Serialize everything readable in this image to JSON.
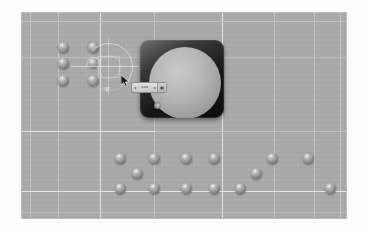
{
  "app": {
    "name": "3d-viewport-render",
    "view_label": "",
    "background_color": "#a9a9a9",
    "border_color": "#bdbdbd"
  },
  "viewport": {
    "name": "perspective-viewport",
    "width": 324,
    "height": 205,
    "origin_x": 22,
    "origin_y": 13,
    "grid": {
      "color": "#c2c2c2",
      "highlight_color": "#e6e6e6",
      "vertical_lines": [
        {
          "x": 8,
          "bright": false
        },
        {
          "x": 36,
          "bright": false
        },
        {
          "x": 78,
          "bright": true
        },
        {
          "x": 132,
          "bright": false
        },
        {
          "x": 200,
          "bright": true
        },
        {
          "x": 252,
          "bright": false
        },
        {
          "x": 292,
          "bright": false
        },
        {
          "x": 318,
          "bright": false
        }
      ],
      "horizontal_lines": [
        {
          "y": 8,
          "bright": false,
          "x_start": 0,
          "x_end": 324
        },
        {
          "y": 44,
          "bright": false,
          "x_start": 0,
          "x_end": 324
        },
        {
          "y": 118,
          "bright": true,
          "x_start": 0,
          "x_end": 133
        },
        {
          "y": 118,
          "bright": false,
          "x_start": 133,
          "x_end": 324
        },
        {
          "y": 178,
          "bright": true,
          "x_start": 0,
          "x_end": 324
        },
        {
          "y": 199,
          "bright": false,
          "x_start": 0,
          "x_end": 324
        }
      ]
    }
  },
  "objects": {
    "label": "spheres",
    "upper_cluster": {
      "name": "upper-sphere-grid",
      "columns": 2,
      "rows": 3,
      "items": [
        {
          "id": "sphere-u1",
          "x": 36,
          "y": 29,
          "d": 11
        },
        {
          "id": "sphere-u2",
          "x": 66,
          "y": 29,
          "d": 11
        },
        {
          "id": "sphere-u3",
          "x": 36,
          "y": 45,
          "d": 11
        },
        {
          "id": "sphere-u4",
          "x": 66,
          "y": 45,
          "d": 11,
          "selected": true
        },
        {
          "id": "sphere-u5",
          "x": 36,
          "y": 62,
          "d": 11
        },
        {
          "id": "sphere-u6",
          "x": 66,
          "y": 62,
          "d": 11
        }
      ]
    },
    "lower_cluster": {
      "name": "lower-sphere-field",
      "items": [
        {
          "id": "sphere-l1",
          "x": 93,
          "y": 140,
          "d": 11
        },
        {
          "id": "sphere-l2",
          "x": 127,
          "y": 140,
          "d": 11
        },
        {
          "id": "sphere-l3",
          "x": 110,
          "y": 155,
          "d": 11
        },
        {
          "id": "sphere-l4",
          "x": 93,
          "y": 170,
          "d": 11
        },
        {
          "id": "sphere-l5",
          "x": 127,
          "y": 170,
          "d": 11
        },
        {
          "id": "sphere-l6",
          "x": 159,
          "y": 140,
          "d": 11
        },
        {
          "id": "sphere-l7",
          "x": 187,
          "y": 140,
          "d": 11
        },
        {
          "id": "sphere-l8",
          "x": 159,
          "y": 170,
          "d": 11
        },
        {
          "id": "sphere-l9",
          "x": 187,
          "y": 170,
          "d": 11
        },
        {
          "id": "sphere-l10",
          "x": 213,
          "y": 170,
          "d": 11
        },
        {
          "id": "sphere-l11",
          "x": 229,
          "y": 155,
          "d": 11
        },
        {
          "id": "sphere-l12",
          "x": 245,
          "y": 140,
          "d": 11
        },
        {
          "id": "sphere-l13",
          "x": 281,
          "y": 140,
          "d": 11
        },
        {
          "id": "sphere-l14",
          "x": 303,
          "y": 170,
          "d": 11
        }
      ]
    }
  },
  "preview_panel": {
    "name": "material-preview-panel",
    "x": 118,
    "y": 27,
    "width": 84,
    "height": 78,
    "background_color": "#141414",
    "sphere_color": "#b6b6b6",
    "title": ""
  },
  "slider": {
    "name": "value-slider-widget",
    "x": 110,
    "y": 70,
    "width": 34,
    "height": 9,
    "value": "0.00",
    "left_arrow": "◂",
    "right_arrow": "▸",
    "icon": "▣"
  },
  "gizmo": {
    "name": "rotate-gizmo",
    "x": 63,
    "y": 30,
    "size": 48,
    "type": "rotation-ring"
  },
  "cursor": {
    "name": "mouse-cursor",
    "x": 99,
    "y": 62,
    "type": "arrow"
  }
}
